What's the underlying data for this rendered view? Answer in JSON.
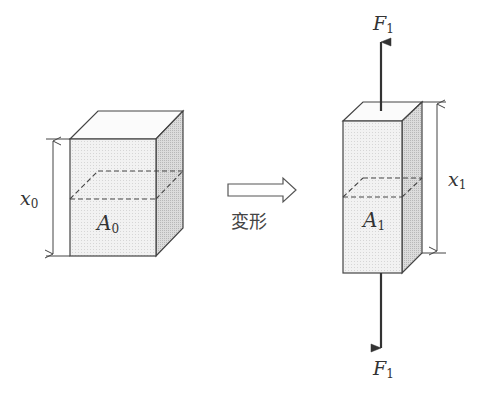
{
  "diagram": {
    "left_block": {
      "height_label": "x",
      "height_sub": "0",
      "area_label": "A",
      "area_sub": "0"
    },
    "transition": {
      "label": "変形"
    },
    "right_block": {
      "height_label": "x",
      "height_sub": "1",
      "area_label": "A",
      "area_sub": "1",
      "force_top_label": "F",
      "force_top_sub": "1",
      "force_bottom_label": "F",
      "force_bottom_sub": "1"
    },
    "colors": {
      "face_front": "#f1f1f1",
      "face_top": "#fafafa",
      "face_side": "#d9d9d9",
      "stroke": "#444444"
    }
  }
}
